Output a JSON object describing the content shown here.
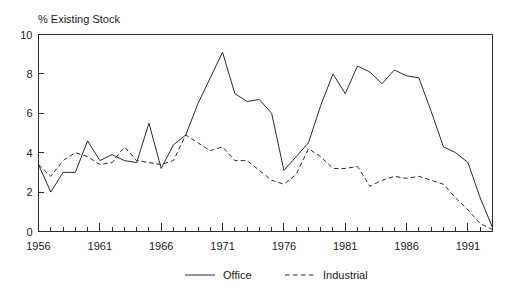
{
  "chart_data": {
    "type": "line",
    "title": "% Existing Stock",
    "xlabel": "",
    "ylabel": "",
    "grid": false,
    "legend_position": "bottom",
    "xlim": [
      1956,
      1993
    ],
    "ylim": [
      0,
      10
    ],
    "yticks": [
      0,
      2,
      4,
      6,
      8,
      10
    ],
    "ytick_labels": [
      "0",
      "2",
      "4",
      "6",
      "8",
      "10"
    ],
    "xticks": [
      1956,
      1957,
      1958,
      1959,
      1960,
      1961,
      1962,
      1963,
      1964,
      1965,
      1966,
      1967,
      1968,
      1969,
      1970,
      1971,
      1972,
      1973,
      1974,
      1975,
      1976,
      1977,
      1978,
      1979,
      1980,
      1981,
      1982,
      1983,
      1984,
      1985,
      1986,
      1987,
      1988,
      1989,
      1990,
      1991,
      1992,
      1993
    ],
    "xtick_labels_major": [
      "1956",
      "1961",
      "1966",
      "1971",
      "1976",
      "1981",
      "1986",
      "1991"
    ],
    "xticks_major": [
      1956,
      1961,
      1966,
      1971,
      1976,
      1981,
      1986,
      1991
    ],
    "x": [
      1956,
      1957,
      1958,
      1959,
      1960,
      1961,
      1962,
      1963,
      1964,
      1965,
      1966,
      1967,
      1968,
      1969,
      1970,
      1971,
      1972,
      1973,
      1974,
      1975,
      1976,
      1977,
      1978,
      1979,
      1980,
      1981,
      1982,
      1983,
      1984,
      1985,
      1986,
      1987,
      1988,
      1989,
      1990,
      1991,
      1992,
      1993
    ],
    "series": [
      {
        "name": "Office",
        "style": "solid",
        "color": "#2b2b2b",
        "values": [
          3.4,
          2.0,
          3.0,
          3.0,
          4.6,
          3.6,
          3.9,
          3.6,
          3.5,
          5.5,
          3.2,
          4.4,
          4.9,
          6.5,
          7.8,
          9.1,
          7.0,
          6.6,
          6.7,
          6.0,
          3.1,
          3.8,
          4.5,
          6.4,
          8.0,
          7.0,
          8.4,
          8.1,
          7.5,
          8.2,
          7.9,
          7.8,
          6.1,
          4.3,
          4.0,
          3.5,
          1.7,
          0.2
        ]
      },
      {
        "name": "Industrial",
        "style": "dashed",
        "color": "#2b2b2b",
        "values": [
          3.4,
          2.8,
          3.6,
          4.0,
          3.8,
          3.4,
          3.5,
          4.3,
          3.6,
          3.5,
          3.4,
          3.6,
          4.9,
          4.5,
          4.1,
          4.3,
          3.6,
          3.6,
          3.1,
          2.6,
          2.4,
          2.9,
          4.2,
          3.8,
          3.2,
          3.2,
          3.3,
          2.3,
          2.6,
          2.8,
          2.7,
          2.8,
          2.6,
          2.4,
          1.7,
          1.1,
          0.4,
          0.1
        ]
      }
    ]
  },
  "legend": {
    "entries": [
      {
        "label": "Office",
        "style": "solid"
      },
      {
        "label": "Industrial",
        "style": "dashed"
      }
    ]
  }
}
